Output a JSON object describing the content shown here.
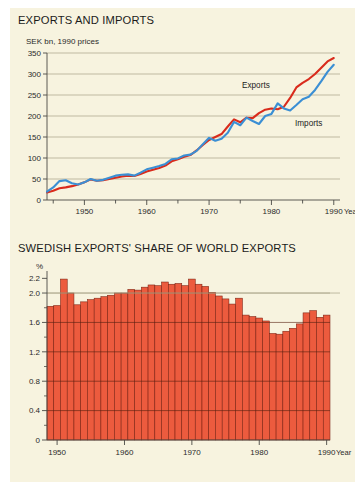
{
  "page": {
    "background": "#ffffff",
    "panel_background": "#f7f3df"
  },
  "colors": {
    "exports_line": "#d92b1c",
    "imports_line": "#3b8fd4",
    "bar_fill": "#ec5b3e",
    "bar_stroke": "#7a1f10",
    "gridline": "#9a9378",
    "axis": "#4a4a45",
    "text": "#1b1b1b"
  },
  "charts": {
    "top": {
      "title": "EXPORTS AND IMPORTS",
      "unit_label": "SEK bn, 1990 prices",
      "x_axis_title": "Year",
      "y_ticks": [
        "0",
        "50",
        "100",
        "150",
        "200",
        "250",
        "300",
        "350"
      ],
      "x_ticks": [
        "1950",
        "1960",
        "1970",
        "1980",
        "1990"
      ],
      "series_labels": {
        "exports": "Exports",
        "imports": "Imports"
      }
    },
    "bottom": {
      "title": "SWEDISH EXPORTS' SHARE OF WORLD EXPORTS",
      "unit_label": "%",
      "x_axis_title": "Year",
      "y_ticks": [
        "0",
        "0.4",
        "0.8",
        "1.2",
        "1.6",
        "2.0",
        "2.2"
      ],
      "x_ticks": [
        "1950",
        "1960",
        "1970",
        "1980",
        "1990"
      ]
    }
  },
  "chart_data": [
    {
      "type": "line",
      "id": "exports-and-imports",
      "title": "EXPORTS AND IMPORTS",
      "xlabel": "Year",
      "ylabel": "SEK bn, 1990 prices",
      "xlim": [
        1944,
        1991
      ],
      "ylim": [
        0,
        350
      ],
      "yticks": [
        0,
        50,
        100,
        150,
        200,
        250,
        300,
        350
      ],
      "xticks": [
        1950,
        1960,
        1970,
        1980,
        1990
      ],
      "grid": true,
      "legend": "inline-annotations",
      "x": [
        1944,
        1945,
        1946,
        1947,
        1948,
        1949,
        1950,
        1951,
        1952,
        1953,
        1954,
        1955,
        1956,
        1957,
        1958,
        1959,
        1960,
        1961,
        1962,
        1963,
        1964,
        1965,
        1966,
        1967,
        1968,
        1969,
        1970,
        1971,
        1972,
        1973,
        1974,
        1975,
        1976,
        1977,
        1978,
        1979,
        1980,
        1981,
        1982,
        1983,
        1984,
        1985,
        1986,
        1987,
        1988,
        1989,
        1990
      ],
      "series": [
        {
          "name": "Exports",
          "color": "#d92b1c",
          "values": [
            18,
            22,
            28,
            30,
            33,
            37,
            42,
            49,
            46,
            47,
            50,
            53,
            56,
            58,
            57,
            62,
            68,
            72,
            76,
            82,
            92,
            97,
            103,
            107,
            118,
            131,
            143,
            150,
            157,
            175,
            192,
            185,
            196,
            195,
            207,
            215,
            218,
            216,
            222,
            243,
            268,
            279,
            288,
            300,
            315,
            330,
            338
          ]
        },
        {
          "name": "Imports",
          "color": "#3b8fd4",
          "values": [
            20,
            30,
            45,
            47,
            40,
            37,
            42,
            50,
            46,
            48,
            53,
            58,
            60,
            61,
            58,
            65,
            73,
            77,
            81,
            86,
            97,
            99,
            106,
            108,
            117,
            133,
            148,
            141,
            146,
            160,
            186,
            178,
            196,
            188,
            181,
            200,
            205,
            230,
            218,
            213,
            226,
            240,
            246,
            262,
            283,
            305,
            322
          ]
        }
      ]
    },
    {
      "type": "bar",
      "id": "swedish-exports-share-of-world-exports",
      "title": "SWEDISH EXPORTS' SHARE OF WORLD EXPORTS",
      "xlabel": "Year",
      "ylabel": "%",
      "ylim": [
        0,
        2.3
      ],
      "yticks": [
        0,
        0.4,
        0.8,
        1.2,
        1.6,
        2.0,
        2.2
      ],
      "xticks": [
        1950,
        1960,
        1970,
        1980,
        1990
      ],
      "grid": true,
      "categories": [
        1949,
        1950,
        1951,
        1952,
        1953,
        1954,
        1955,
        1956,
        1957,
        1958,
        1959,
        1960,
        1961,
        1962,
        1963,
        1964,
        1965,
        1966,
        1967,
        1968,
        1969,
        1970,
        1971,
        1972,
        1973,
        1974,
        1975,
        1976,
        1977,
        1978,
        1979,
        1980,
        1981,
        1982,
        1983,
        1984,
        1985,
        1986,
        1987,
        1988,
        1989,
        1990
      ],
      "values": [
        1.82,
        1.83,
        2.19,
        2.0,
        1.84,
        1.88,
        1.91,
        1.93,
        1.95,
        1.97,
        2.0,
        2.0,
        2.05,
        2.04,
        2.08,
        2.11,
        2.1,
        2.15,
        2.12,
        2.13,
        2.1,
        2.19,
        2.12,
        2.09,
        2.01,
        1.96,
        1.92,
        1.85,
        1.93,
        1.7,
        1.68,
        1.66,
        1.62,
        1.45,
        1.44,
        1.48,
        1.52,
        1.58,
        1.73,
        1.76,
        1.67,
        1.7
      ]
    }
  ]
}
